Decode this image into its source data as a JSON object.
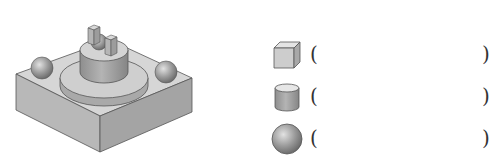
{
  "figure": {
    "components": [
      "cuboid-base",
      "sphere-left",
      "sphere-right",
      "disc-cylinder",
      "cylinder",
      "small-sphere",
      "small-cuboid-1",
      "small-cuboid-2"
    ]
  },
  "questions": [
    {
      "shape": "cube-icon",
      "open": "(",
      "answer": "",
      "close": ")"
    },
    {
      "shape": "cylinder-icon",
      "open": "(",
      "answer": "",
      "close": ")"
    },
    {
      "shape": "sphere-icon",
      "open": "(",
      "answer": "",
      "close": ")"
    }
  ]
}
